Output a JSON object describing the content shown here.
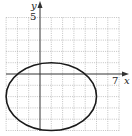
{
  "chart_data": {
    "type": "line",
    "title": "",
    "xlabel": "x",
    "ylabel": "y",
    "xlim": [
      -3,
      7
    ],
    "ylim": [
      -5,
      5
    ],
    "grid": true,
    "tick_labels": {
      "x": [
        "7"
      ],
      "y": [
        "5"
      ]
    },
    "series": [
      {
        "name": "ellipse",
        "shape": "ellipse",
        "center": [
          1,
          -2
        ],
        "semi_axis_x": 4,
        "semi_axis_y": 3,
        "equation": "(x-1)^2/16 + (y+2)^2/9 = 1"
      }
    ]
  },
  "axes": {
    "x_label": "x",
    "y_label": "y",
    "x_tick": "7",
    "y_tick": "5"
  },
  "colors": {
    "grid": "#9a9a9a",
    "axis": "#333333",
    "curve": "#1a1a1a"
  }
}
